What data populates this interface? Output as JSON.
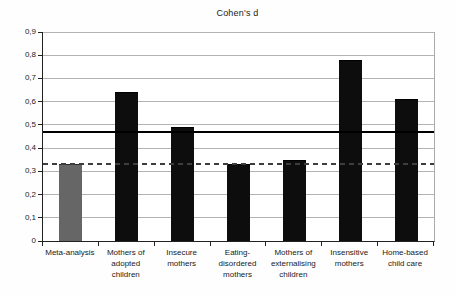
{
  "chart_data": {
    "type": "bar",
    "title": "Cohen's d",
    "categories": [
      "Meta-analysis",
      "Mothers of adopted children",
      "Insecure mothers",
      "Eating-disordered mothers",
      "Mothers of externalising children",
      "Insensitive mothers",
      "Home-based child care"
    ],
    "category_label_lines": [
      [
        "Meta-analysis"
      ],
      [
        "Mothers of",
        "adopted",
        "children"
      ],
      [
        "Insecure",
        "mothers"
      ],
      [
        "Eating-",
        "disordered",
        "mothers"
      ],
      [
        "Mothers of",
        "externalising",
        "children"
      ],
      [
        "Insensitive",
        "mothers"
      ],
      [
        "Home-based",
        "child care"
      ]
    ],
    "values": [
      0.33,
      0.64,
      0.49,
      0.33,
      0.35,
      0.78,
      0.61
    ],
    "bar_colors": [
      "#666666",
      "#0d0d0d",
      "#0d0d0d",
      "#0d0d0d",
      "#0d0d0d",
      "#0d0d0d",
      "#0d0d0d"
    ],
    "bar_border_colors": [
      "#2a2a2a",
      "#000000",
      "#000000",
      "#000000",
      "#000000",
      "#000000",
      "#000000"
    ],
    "xlabel": "",
    "ylabel": "",
    "ylim": [
      0,
      0.9
    ],
    "yticks": {
      "values": [
        0,
        0.1,
        0.2,
        0.3,
        0.4,
        0.5,
        0.6,
        0.7,
        0.8,
        0.9
      ],
      "labels": [
        "0",
        "0,1",
        "0,2",
        "0,3",
        "0,4",
        "0,5",
        "0,6",
        "0,7",
        "0,8",
        "0,9"
      ]
    },
    "grid": true,
    "legend": "none",
    "reference_lines": [
      {
        "value": 0.47,
        "style": "solid",
        "color": "#000000",
        "name": "solid-reference-line"
      },
      {
        "value": 0.33,
        "style": "dashed",
        "color": "#3d3d3d",
        "name": "dashed-reference-line"
      }
    ],
    "colors": {
      "gridline": "#b3b3b3",
      "axis": "#222222",
      "background": "#ffffff"
    }
  }
}
